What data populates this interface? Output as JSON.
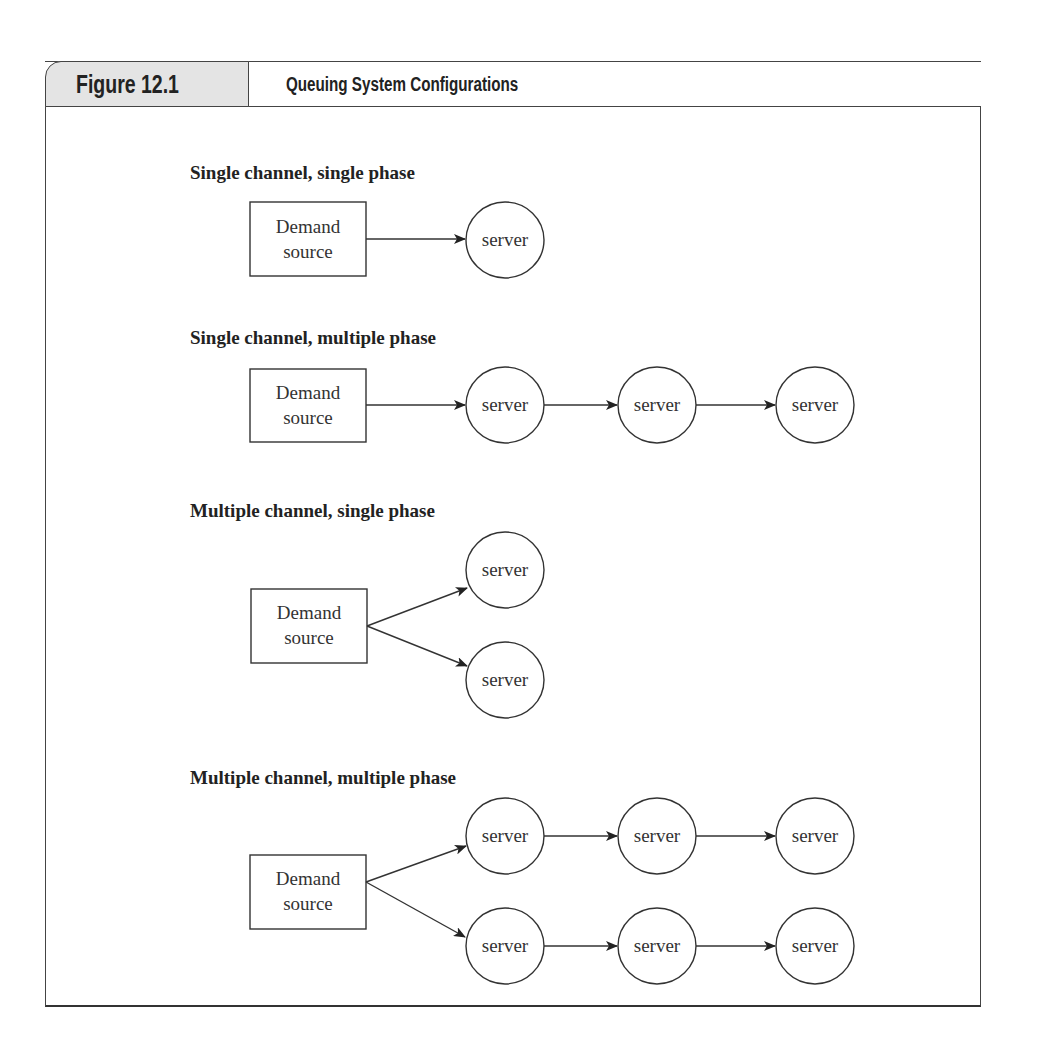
{
  "figure": {
    "number": "Figure 12.1",
    "title": "Queuing System Configurations"
  },
  "sections": [
    {
      "label": "Single channel, single phase",
      "source": {
        "line1": "Demand",
        "line2": "source"
      },
      "servers": [
        "server"
      ]
    },
    {
      "label": "Single channel, multiple phase",
      "source": {
        "line1": "Demand",
        "line2": "source"
      },
      "servers": [
        "server",
        "server",
        "server"
      ]
    },
    {
      "label": "Multiple channel, single phase",
      "source": {
        "line1": "Demand",
        "line2": "source"
      },
      "channels": [
        [
          "server"
        ],
        [
          "server"
        ]
      ]
    },
    {
      "label": "Multiple channel, multiple phase",
      "source": {
        "line1": "Demand",
        "line2": "source"
      },
      "channels": [
        [
          "server",
          "server",
          "server"
        ],
        [
          "server",
          "server",
          "server"
        ]
      ]
    }
  ],
  "colors": {
    "stroke": "#333333",
    "tab_fill": "#e4e4e4",
    "text": "#222222"
  }
}
